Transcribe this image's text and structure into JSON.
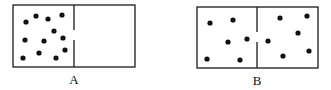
{
  "diagram": {
    "panels": [
      {
        "label": "A",
        "box": {
          "x": 13,
          "y": 5,
          "w": 122,
          "h": 62
        },
        "divider_x": 74,
        "divider_gap": [
          30,
          40
        ],
        "dots": [
          [
            26,
            22
          ],
          [
            36,
            16
          ],
          [
            48,
            19
          ],
          [
            62,
            15
          ],
          [
            54,
            31
          ],
          [
            25,
            40
          ],
          [
            44,
            41
          ],
          [
            63,
            38
          ],
          [
            65,
            50
          ],
          [
            23,
            58
          ],
          [
            39,
            53
          ],
          [
            56,
            58
          ]
        ],
        "label_pos": {
          "x": 74,
          "y": 72
        }
      },
      {
        "label": "B",
        "box": {
          "x": 197,
          "y": 7,
          "w": 121,
          "h": 61
        },
        "divider_x": 257,
        "divider_gap": [
          32,
          42
        ],
        "dots": [
          [
            210,
            23
          ],
          [
            233,
            20
          ],
          [
            228,
            42
          ],
          [
            247,
            39
          ],
          [
            207,
            59
          ],
          [
            240,
            60
          ],
          [
            280,
            18
          ],
          [
            307,
            16
          ],
          [
            298,
            33
          ],
          [
            268,
            41
          ],
          [
            283,
            56
          ],
          [
            309,
            51
          ]
        ],
        "label_pos": {
          "x": 257,
          "y": 73
        }
      }
    ],
    "colors": {
      "stroke": "#1a1a1a",
      "dot": "#111111",
      "background": "#ffffff"
    }
  }
}
